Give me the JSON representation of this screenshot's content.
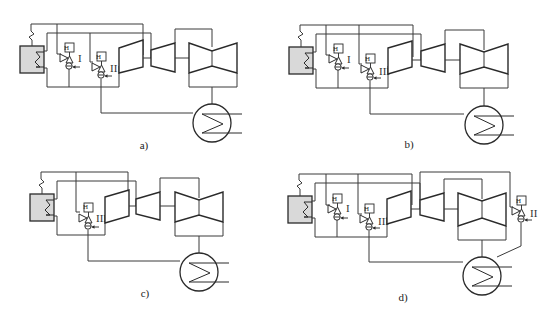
{
  "figure": {
    "panels": [
      {
        "id": "a",
        "caption": "a)",
        "valves": [
          {
            "tag": "H",
            "numeral": "I"
          },
          {
            "tag": "H",
            "numeral": "II"
          }
        ]
      },
      {
        "id": "b",
        "caption": "b)",
        "valves": [
          {
            "tag": "H",
            "numeral": "I"
          },
          {
            "tag": "H",
            "numeral": "III"
          }
        ]
      },
      {
        "id": "c",
        "caption": "c)",
        "valves": [
          {
            "tag": "H",
            "numeral": "III"
          }
        ]
      },
      {
        "id": "d",
        "caption": "d)",
        "valves": [
          {
            "tag": "H",
            "numeral": "I"
          },
          {
            "tag": "H",
            "numeral": "III"
          },
          {
            "tag": "H",
            "numeral": "II"
          }
        ]
      }
    ],
    "colors": {
      "line": "#3a3a3a",
      "boiler_fill": "#d9d9d9",
      "background": "#ffffff"
    }
  }
}
